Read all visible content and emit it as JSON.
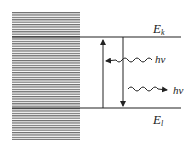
{
  "diagram": {
    "type": "energy-level-diagram",
    "levels": [
      {
        "id": "upper",
        "label_main": "E",
        "label_sub": "k"
      },
      {
        "id": "lower",
        "label_main": "E",
        "label_sub": "l"
      }
    ],
    "photons": [
      {
        "id": "absorbed",
        "label": "hν",
        "direction": "incoming"
      },
      {
        "id": "emitted",
        "label": "hν",
        "direction": "outgoing"
      }
    ],
    "transitions": [
      {
        "id": "absorption",
        "from": "lower",
        "to": "upper",
        "direction": "up"
      },
      {
        "id": "emission",
        "from": "upper",
        "to": "lower",
        "direction": "down"
      }
    ],
    "colors": {
      "line": "#222222",
      "hatch": "#555555",
      "background": "#ffffff"
    }
  }
}
